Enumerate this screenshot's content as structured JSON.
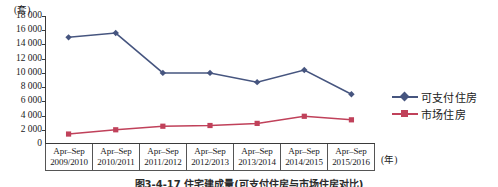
{
  "chart_data": {
    "type": "line",
    "title": "",
    "caption": "图3-4-17  住宅建成量(可支付住房与市场住房对比)",
    "xlabel": "(年)",
    "ylabel": "(套)",
    "ylim": [
      0,
      18000
    ],
    "ytick_step": 2000,
    "yticks": [
      "18 000",
      "16 000",
      "14 000",
      "12 000",
      "10 000",
      "8 000",
      "6 000",
      "4 000",
      "2 000",
      "0"
    ],
    "ytick_values": [
      18000,
      16000,
      14000,
      12000,
      10000,
      8000,
      6000,
      4000,
      2000,
      0
    ],
    "grid": false,
    "legend_position": "right",
    "categories": [
      {
        "line1": "Apr–Sep",
        "line2": "2009/2010"
      },
      {
        "line1": "Apr–Sep",
        "line2": "2010/2011"
      },
      {
        "line1": "Apr–Sep",
        "line2": "2011/2012"
      },
      {
        "line1": "Apr–Sep",
        "line2": "2012/2013"
      },
      {
        "line1": "Apr–Sep",
        "line2": "2013/2014"
      },
      {
        "line1": "Apr–Sep",
        "line2": "2014/2015"
      },
      {
        "line1": "Apr–Sep",
        "line2": "2015/2016"
      }
    ],
    "series": [
      {
        "name": "可支付住房",
        "color": "#46557f",
        "marker": "diamond",
        "values": [
          15000,
          15600,
          10000,
          10000,
          8700,
          10400,
          7000
        ]
      },
      {
        "name": "市场住房",
        "color": "#c0415a",
        "marker": "square",
        "values": [
          1400,
          2000,
          2500,
          2600,
          2900,
          3900,
          3400
        ]
      }
    ]
  },
  "legend": {
    "items": [
      {
        "label": "可支付住房",
        "color": "#46557f",
        "marker": "diamond"
      },
      {
        "label": "市场住房",
        "color": "#c0415a",
        "marker": "square"
      }
    ]
  }
}
